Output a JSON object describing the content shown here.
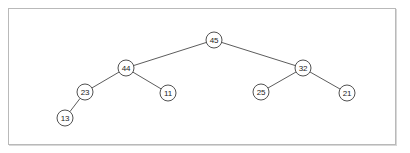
{
  "diagram": {
    "type": "binary-tree",
    "title": "",
    "frame": {
      "border_color": "#b9b9b9",
      "background": "#ffffff"
    },
    "style": {
      "node_fill": "#ffffff",
      "node_stroke": "#3d3d3d",
      "edge_color": "#4a4a4a",
      "node_radius": 8,
      "label_color": "#1d1d1d"
    },
    "nodes": [
      {
        "id": "n45",
        "label": "45",
        "x": 214,
        "y": 40,
        "level": 0
      },
      {
        "id": "n44",
        "label": "44",
        "x": 126,
        "y": 68,
        "level": 1
      },
      {
        "id": "n32",
        "label": "32",
        "x": 303,
        "y": 68,
        "level": 1
      },
      {
        "id": "n23",
        "label": "23",
        "x": 85,
        "y": 92,
        "level": 2
      },
      {
        "id": "n11",
        "label": "11",
        "x": 168,
        "y": 93,
        "level": 2
      },
      {
        "id": "n25",
        "label": "25",
        "x": 261,
        "y": 92,
        "level": 2
      },
      {
        "id": "n21",
        "label": "21",
        "x": 347,
        "y": 93,
        "level": 2
      },
      {
        "id": "n13",
        "label": "13",
        "x": 65,
        "y": 118,
        "level": 3
      }
    ],
    "edges": [
      {
        "from": "n45",
        "to": "n44"
      },
      {
        "from": "n45",
        "to": "n32"
      },
      {
        "from": "n44",
        "to": "n23"
      },
      {
        "from": "n44",
        "to": "n11"
      },
      {
        "from": "n32",
        "to": "n25"
      },
      {
        "from": "n32",
        "to": "n21"
      },
      {
        "from": "n23",
        "to": "n13"
      }
    ]
  }
}
